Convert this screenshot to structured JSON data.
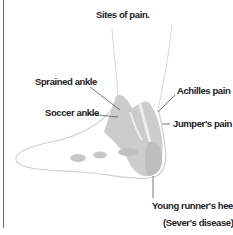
{
  "diagram": {
    "title": "Sites of pain.",
    "labels": {
      "sprained_ankle": "Sprained ankle",
      "soccer_ankle": "Soccer ankle",
      "achilles_pain": "Achilles pain",
      "jumpers_pain": "Jumper's pain",
      "young_runners_heel": "Young runner's heel",
      "severs_disease": "(Sever's disease)"
    },
    "colors": {
      "highlight": "#c8c8c8",
      "outline": "#d0d0d0",
      "leader": "#555555"
    }
  }
}
